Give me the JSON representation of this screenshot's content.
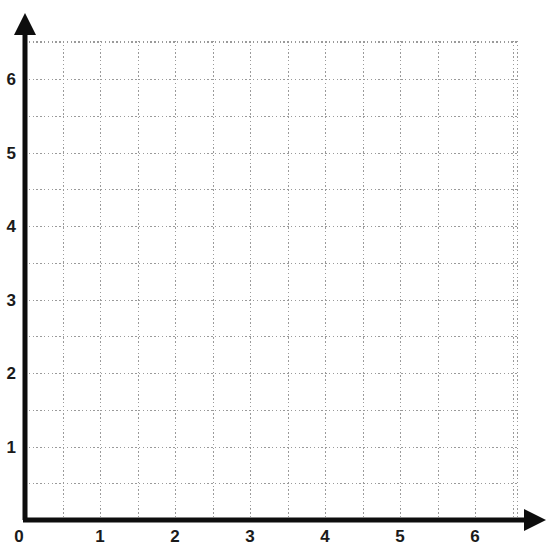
{
  "page": {
    "background_color": "#ffffff"
  },
  "top_strip": {
    "description": "bottom edge of a cut-off table row above the grid",
    "border_color": "#8a8a8a",
    "cells": [
      {
        "left": 0,
        "width": 120
      },
      {
        "left": 120,
        "width": 85
      },
      {
        "left": 205,
        "width": 85
      },
      {
        "left": 290,
        "width": 13
      },
      {
        "left": 308,
        "width": 230
      },
      {
        "left": 538,
        "width": 17
      }
    ]
  },
  "chart_data": {
    "type": "scatter",
    "title": "",
    "subtitle": "",
    "xlabel": "",
    "ylabel": "",
    "xlim": [
      0,
      6.55
    ],
    "ylim": [
      0,
      6.55
    ],
    "x_major_step": 1,
    "y_major_step": 1,
    "x_minor_step": 0.5,
    "y_minor_step": 0.5,
    "grid": true,
    "grid_style": "dotted",
    "grid_color": "#9a9a9a",
    "axis_color": "#0d0d0d",
    "axis_arrows": true,
    "legend": null,
    "legend_position": "none",
    "x_tick_labels": [
      "0",
      "1",
      "2",
      "3",
      "4",
      "5",
      "6"
    ],
    "x_tick_values": [
      0,
      1,
      2,
      3,
      4,
      5,
      6
    ],
    "y_tick_labels": [
      "1",
      "2",
      "3",
      "4",
      "5",
      "6"
    ],
    "y_tick_values": [
      1,
      2,
      3,
      4,
      5,
      6
    ],
    "origin_label": "0",
    "series": [
      {
        "name": "",
        "x": [],
        "y": []
      }
    ],
    "annotations": [],
    "note": "Empty plotting grid — no data points, lines or markers are drawn."
  },
  "geometry": {
    "origin_px": {
      "x": 25,
      "y": 520
    },
    "x_unit_px": 75,
    "y_unit_px": 73.5,
    "grid_right_px": 517,
    "grid_top_px": 41,
    "x_arrow_tip_px": 546,
    "y_arrow_tip_px": 13
  }
}
